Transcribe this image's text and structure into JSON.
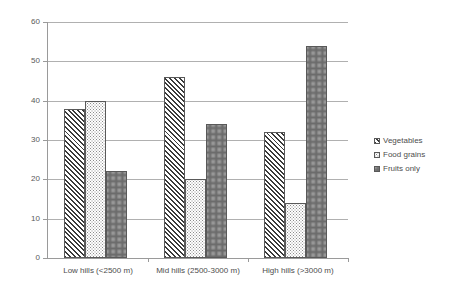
{
  "chart_data": {
    "type": "bar",
    "title": "",
    "xlabel": "",
    "ylabel": "",
    "ylim": [
      0,
      60
    ],
    "yticks": [
      0,
      10,
      20,
      30,
      40,
      50,
      60
    ],
    "grid": true,
    "legend_position": "right",
    "categories": [
      "Low hills (<2500 m)",
      "Mid hills (2500-3000 m)",
      "High hills (>3000 m)"
    ],
    "series": [
      {
        "name": "Vegetables",
        "values": [
          38,
          46,
          32
        ],
        "pattern": "diagonal-hatch"
      },
      {
        "name": "Food grains",
        "values": [
          40,
          20,
          14
        ],
        "pattern": "light-dots"
      },
      {
        "name": "Fruits only",
        "values": [
          22,
          34,
          54
        ],
        "pattern": "dense-dots"
      }
    ]
  },
  "colors": {
    "axis": "#9a9a9a",
    "grid": "#b0b0b0",
    "text": "#4d4d4d",
    "bar_outline": "#595959"
  }
}
